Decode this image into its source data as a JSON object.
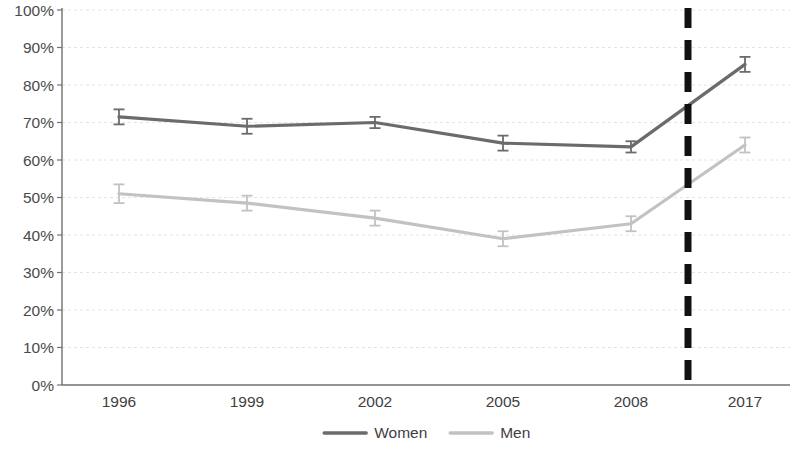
{
  "chart_data": {
    "type": "line",
    "title": "",
    "subtitle": "",
    "xlabel": "",
    "ylabel": "",
    "categories": [
      "1996",
      "1999",
      "2002",
      "2005",
      "2008",
      "2017"
    ],
    "ylim": [
      0,
      100
    ],
    "ytick_labels": [
      "0%",
      "10%",
      "20%",
      "30%",
      "40%",
      "50%",
      "60%",
      "70%",
      "80%",
      "90%",
      "100%"
    ],
    "ytick_values": [
      0,
      10,
      20,
      30,
      40,
      50,
      60,
      70,
      80,
      90,
      100
    ],
    "grid": true,
    "grid_axis": "y",
    "legend_position": "bottom",
    "series": [
      {
        "name": "Women",
        "color": "#6b6b6b",
        "values": [
          71.5,
          69.0,
          70.0,
          64.5,
          63.5,
          85.5
        ],
        "errors": [
          2.0,
          2.0,
          1.5,
          2.0,
          1.5,
          2.0
        ]
      },
      {
        "name": "Men",
        "color": "#c2c2c2",
        "values": [
          51.0,
          48.5,
          44.5,
          39.0,
          43.0,
          64.0
        ],
        "errors": [
          2.5,
          2.0,
          2.0,
          2.0,
          2.0,
          2.0
        ]
      }
    ],
    "annotations": [
      {
        "kind": "vertical-dashed-line",
        "name": "period-break-line",
        "between": [
          "2008",
          "2017"
        ],
        "color": "#111111"
      }
    ]
  },
  "legend": {
    "items": [
      {
        "label": "Women",
        "color": "#6b6b6b"
      },
      {
        "label": "Men",
        "color": "#c2c2c2"
      }
    ]
  },
  "axis": {
    "y_labels": [
      "100%",
      "90%",
      "80%",
      "70%",
      "60%",
      "50%",
      "40%",
      "30%",
      "20%",
      "10%",
      "0%"
    ],
    "x_labels": [
      "1996",
      "1999",
      "2002",
      "2005",
      "2008",
      "2017"
    ]
  }
}
